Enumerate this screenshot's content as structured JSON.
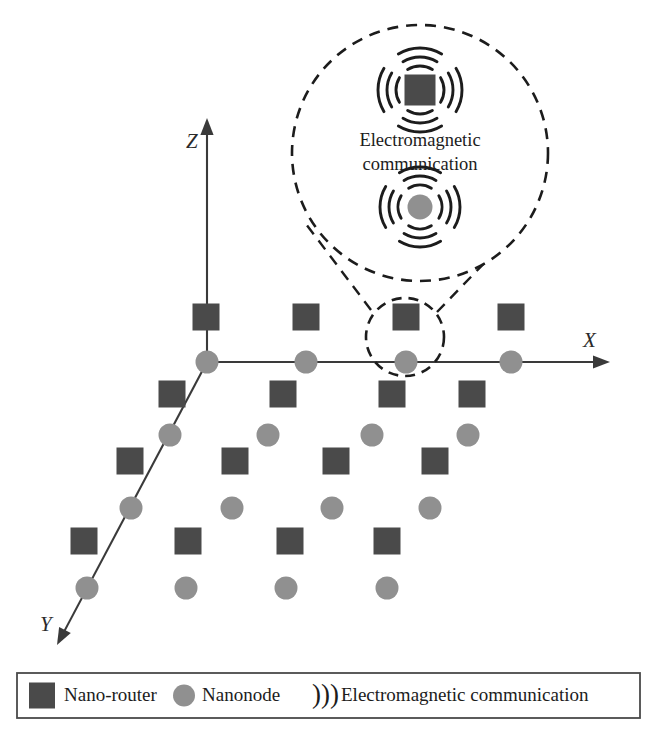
{
  "figure": {
    "type": "diagram",
    "background_color": "#ffffff"
  },
  "colors": {
    "nano_router_fill": "#4a4a4a",
    "nanonode_fill": "#909090",
    "axis_stroke": "#3a3a3a",
    "dashed_stroke": "#1c1c1c",
    "wave_stroke": "#1c1c1c",
    "legend_border": "#4a4a4a",
    "text": "#1c1c1c"
  },
  "axes": {
    "x": {
      "label": "X",
      "label_x": 583,
      "label_y": 347,
      "from": [
        207,
        362
      ],
      "to": [
        610,
        362
      ]
    },
    "y": {
      "label": "Y",
      "label_x": 40,
      "label_y": 631,
      "from": [
        207,
        362
      ],
      "to": [
        57,
        645
      ]
    },
    "z": {
      "label": "Z",
      "label_x": 186,
      "label_y": 148,
      "from": [
        207,
        362
      ],
      "to": [
        207,
        118
      ]
    }
  },
  "glyphs": {
    "nano_router_size": 27,
    "nanonode_radius": 11.5
  },
  "nano_routers": [
    {
      "x": 206,
      "y": 317
    },
    {
      "x": 306,
      "y": 317
    },
    {
      "x": 406,
      "y": 317
    },
    {
      "x": 511,
      "y": 317
    },
    {
      "x": 172,
      "y": 394
    },
    {
      "x": 283,
      "y": 394
    },
    {
      "x": 392,
      "y": 394
    },
    {
      "x": 472,
      "y": 394
    },
    {
      "x": 130,
      "y": 461
    },
    {
      "x": 235,
      "y": 461
    },
    {
      "x": 336,
      "y": 461
    },
    {
      "x": 435,
      "y": 461
    },
    {
      "x": 84,
      "y": 541
    },
    {
      "x": 188,
      "y": 541
    },
    {
      "x": 290,
      "y": 541
    },
    {
      "x": 387,
      "y": 541
    }
  ],
  "nanonodes": [
    {
      "x": 207,
      "y": 362
    },
    {
      "x": 306,
      "y": 362
    },
    {
      "x": 406,
      "y": 362
    },
    {
      "x": 511,
      "y": 362
    },
    {
      "x": 170,
      "y": 435
    },
    {
      "x": 268,
      "y": 435
    },
    {
      "x": 372,
      "y": 435
    },
    {
      "x": 468,
      "y": 435
    },
    {
      "x": 131,
      "y": 508
    },
    {
      "x": 232,
      "y": 508
    },
    {
      "x": 332,
      "y": 508
    },
    {
      "x": 430,
      "y": 508
    },
    {
      "x": 87,
      "y": 588
    },
    {
      "x": 186,
      "y": 588
    },
    {
      "x": 286,
      "y": 588
    },
    {
      "x": 387,
      "y": 588
    }
  ],
  "magnifier": {
    "small_circle": {
      "cx": 405,
      "cy": 337,
      "r": 39
    },
    "large_circle": {
      "cx": 420,
      "cy": 153,
      "r": 128
    },
    "connector_left": {
      "x1": 371,
      "y1": 310,
      "x2": 306,
      "y2": 224
    },
    "connector_right": {
      "x1": 437,
      "y1": 312,
      "x2": 527,
      "y2": 219
    }
  },
  "inset": {
    "text_line1": "Electromagnetic",
    "text_line2": "communication",
    "text_x": 420,
    "text_line1_y": 146,
    "text_line2_y": 170,
    "router_node": {
      "x": 420,
      "y": 90,
      "size": 31
    },
    "nano_node": {
      "x": 420,
      "y": 207,
      "r": 12.5
    }
  },
  "legend": {
    "box": {
      "x": 17,
      "y": 673,
      "width": 623,
      "height": 45
    },
    "items": [
      {
        "icon": "nano-router-swatch",
        "label": "Nano-router",
        "icon_x": 42,
        "label_x": 64
      },
      {
        "icon": "nanonode-swatch",
        "label": "Nanonode",
        "icon_x": 184,
        "label_x": 202
      },
      {
        "icon": "wave-swatch",
        "label": "Electromagnetic communication",
        "icon_x": 312,
        "label_x": 341,
        "glyph": ")))"
      }
    ]
  }
}
